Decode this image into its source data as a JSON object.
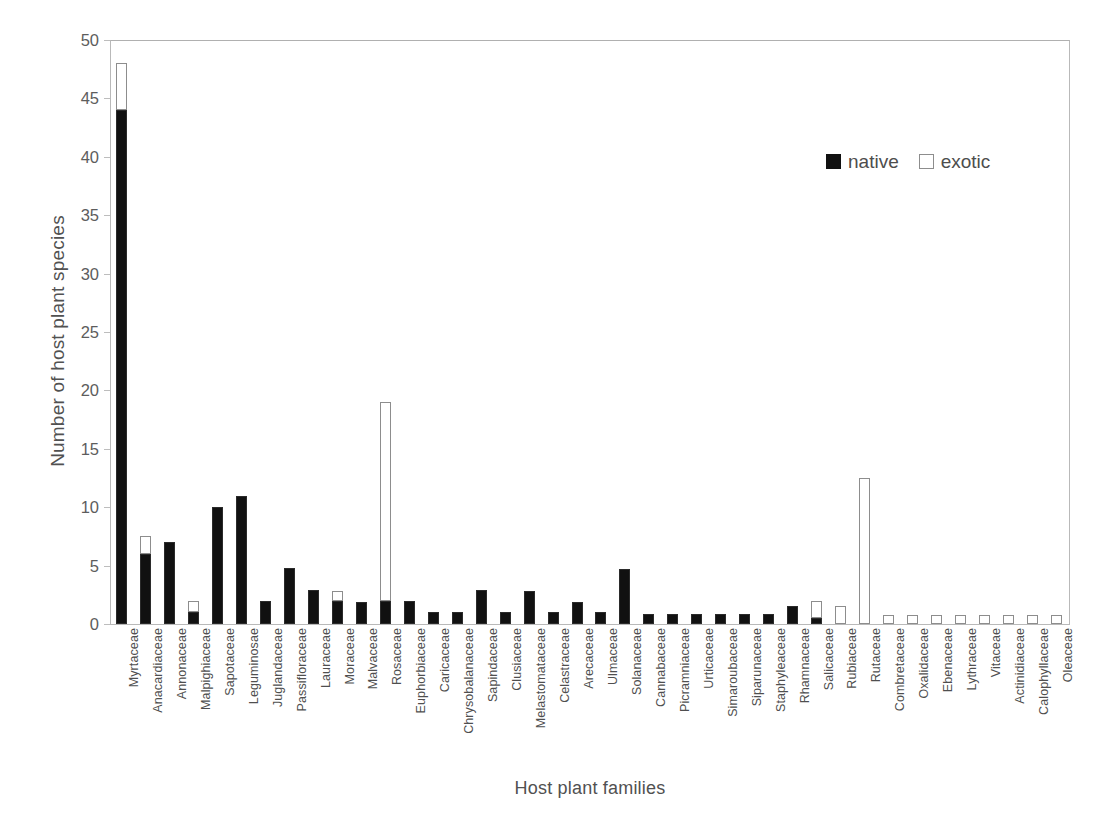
{
  "chart_data": {
    "type": "bar",
    "stacked": true,
    "title": "",
    "xlabel": "Host plant families",
    "ylabel": "Number of host plant species",
    "ylim": [
      0,
      50
    ],
    "yticks": [
      0,
      5,
      10,
      15,
      20,
      25,
      30,
      35,
      40,
      45,
      50
    ],
    "grid": false,
    "legend_position": "top-right",
    "categories": [
      "Myrtaceae",
      "Anacardiaceae",
      "Annonaceae",
      "Malpighiaceae",
      "Sapotaceae",
      "Leguminosae",
      "Juglandaceae",
      "Passifloraceae",
      "Lauraceae",
      "Moraceae",
      "Malvaceae",
      "Rosaceae",
      "Euphorbiaceae",
      "Caricaceae",
      "Chrysobalanaceae",
      "Sapindaceae",
      "Clusiaceae",
      "Melastomataceae",
      "Celastraceae",
      "Arecaceae",
      "Ulmaceae",
      "Solanaceae",
      "Cannabaceae",
      "Picramniaceae",
      "Urticaceae",
      "Simaroubaceae",
      "Siparunaceae",
      "Staphyleaceae",
      "Rhamnaceae",
      "Salicaceae",
      "Rubiaceae",
      "Rutaceae",
      "Combretaceae",
      "Oxalidaceae",
      "Ebenaceae",
      "Lythraceae",
      "Vitaceae",
      "Actinidiaceae",
      "Calophyllaceae",
      "Oleaceae"
    ],
    "series": [
      {
        "name": "native",
        "color": "#111111",
        "values": [
          44,
          6,
          7,
          1,
          10,
          11,
          2,
          4.8,
          2.9,
          2,
          1.9,
          2,
          2,
          1,
          1,
          2.9,
          1,
          2.8,
          1,
          1.9,
          1,
          4.7,
          0.9,
          0.9,
          0.9,
          0.9,
          0.9,
          0.9,
          1.5,
          0.5,
          0,
          0,
          0,
          0,
          0,
          0,
          0,
          0,
          0,
          0
        ]
      },
      {
        "name": "exotic",
        "color": "#ffffff",
        "values": [
          4,
          1.5,
          0,
          1,
          0,
          0,
          0,
          0,
          0,
          0.8,
          0,
          17,
          0,
          0,
          0,
          0,
          0,
          0,
          0,
          0,
          0,
          0,
          0,
          0,
          0,
          0,
          0,
          0,
          0,
          1.5,
          1.5,
          12.5,
          0.5,
          0.5,
          0.5,
          0.5,
          0.5,
          0.5,
          0.5,
          0.5
        ]
      }
    ]
  },
  "legend": {
    "items": [
      {
        "label": "native",
        "marker": "filled-square"
      },
      {
        "label": "exotic",
        "marker": "open-square"
      }
    ]
  },
  "axes": {
    "y_title": "Number of host plant species",
    "x_title": "Host plant families"
  }
}
